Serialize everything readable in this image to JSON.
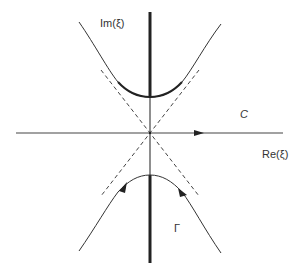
{
  "diagram": {
    "title": "",
    "labels": {
      "imag_axis": "Im(ξ)",
      "real_axis": "Re(ξ)",
      "contour_C": "C",
      "contour_Gamma": "Γ"
    },
    "colors": {
      "stroke": "#333333",
      "background": "#ffffff"
    },
    "elements": [
      {
        "name": "real-axis",
        "type": "line",
        "style": "solid",
        "arrow": "right"
      },
      {
        "name": "imaginary-axis",
        "type": "line",
        "style": "solid",
        "thick_outside_gap": true
      },
      {
        "name": "asymptotes",
        "type": "lines",
        "style": "dashed",
        "count": 2
      },
      {
        "name": "upper-hyperbola",
        "type": "curve",
        "style": "solid"
      },
      {
        "name": "lower-hyperbola-Gamma",
        "type": "curve",
        "style": "solid",
        "arrows": 2
      }
    ]
  }
}
